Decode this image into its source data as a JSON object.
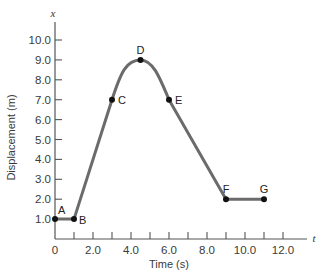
{
  "chart_data": {
    "type": "line",
    "title": "",
    "xlabel": "Time (s)",
    "ylabel": "Displacement (m)",
    "x_axis_variable": "t",
    "y_axis_variable": "x",
    "xlim": [
      0,
      13
    ],
    "ylim": [
      0,
      10.5
    ],
    "x_ticks": [
      0,
      1,
      2,
      3,
      4,
      5,
      6,
      7,
      8,
      9,
      10,
      11,
      12
    ],
    "x_tick_labels": [
      "0",
      "2.0",
      "4.0",
      "6.0",
      "8.0",
      "10.0",
      "12.0"
    ],
    "y_tick_labels": [
      "1.0",
      "2.0",
      "3.0",
      "4.0",
      "5.0",
      "6.0",
      "7.0",
      "8.0",
      "9.0",
      "10.0"
    ],
    "grid": false,
    "series": [
      {
        "name": "displacement",
        "color": "#6b6b6b",
        "points": [
          {
            "label": "A",
            "x": 0,
            "y": 1.0
          },
          {
            "label": "B",
            "x": 1,
            "y": 1.0
          },
          {
            "label": "C",
            "x": 3,
            "y": 7.0
          },
          {
            "label": "D",
            "x": 4.5,
            "y": 9.0
          },
          {
            "label": "E",
            "x": 6,
            "y": 7.0
          },
          {
            "label": "F",
            "x": 9,
            "y": 2.0
          },
          {
            "label": "G",
            "x": 11,
            "y": 2.0
          }
        ]
      }
    ]
  }
}
